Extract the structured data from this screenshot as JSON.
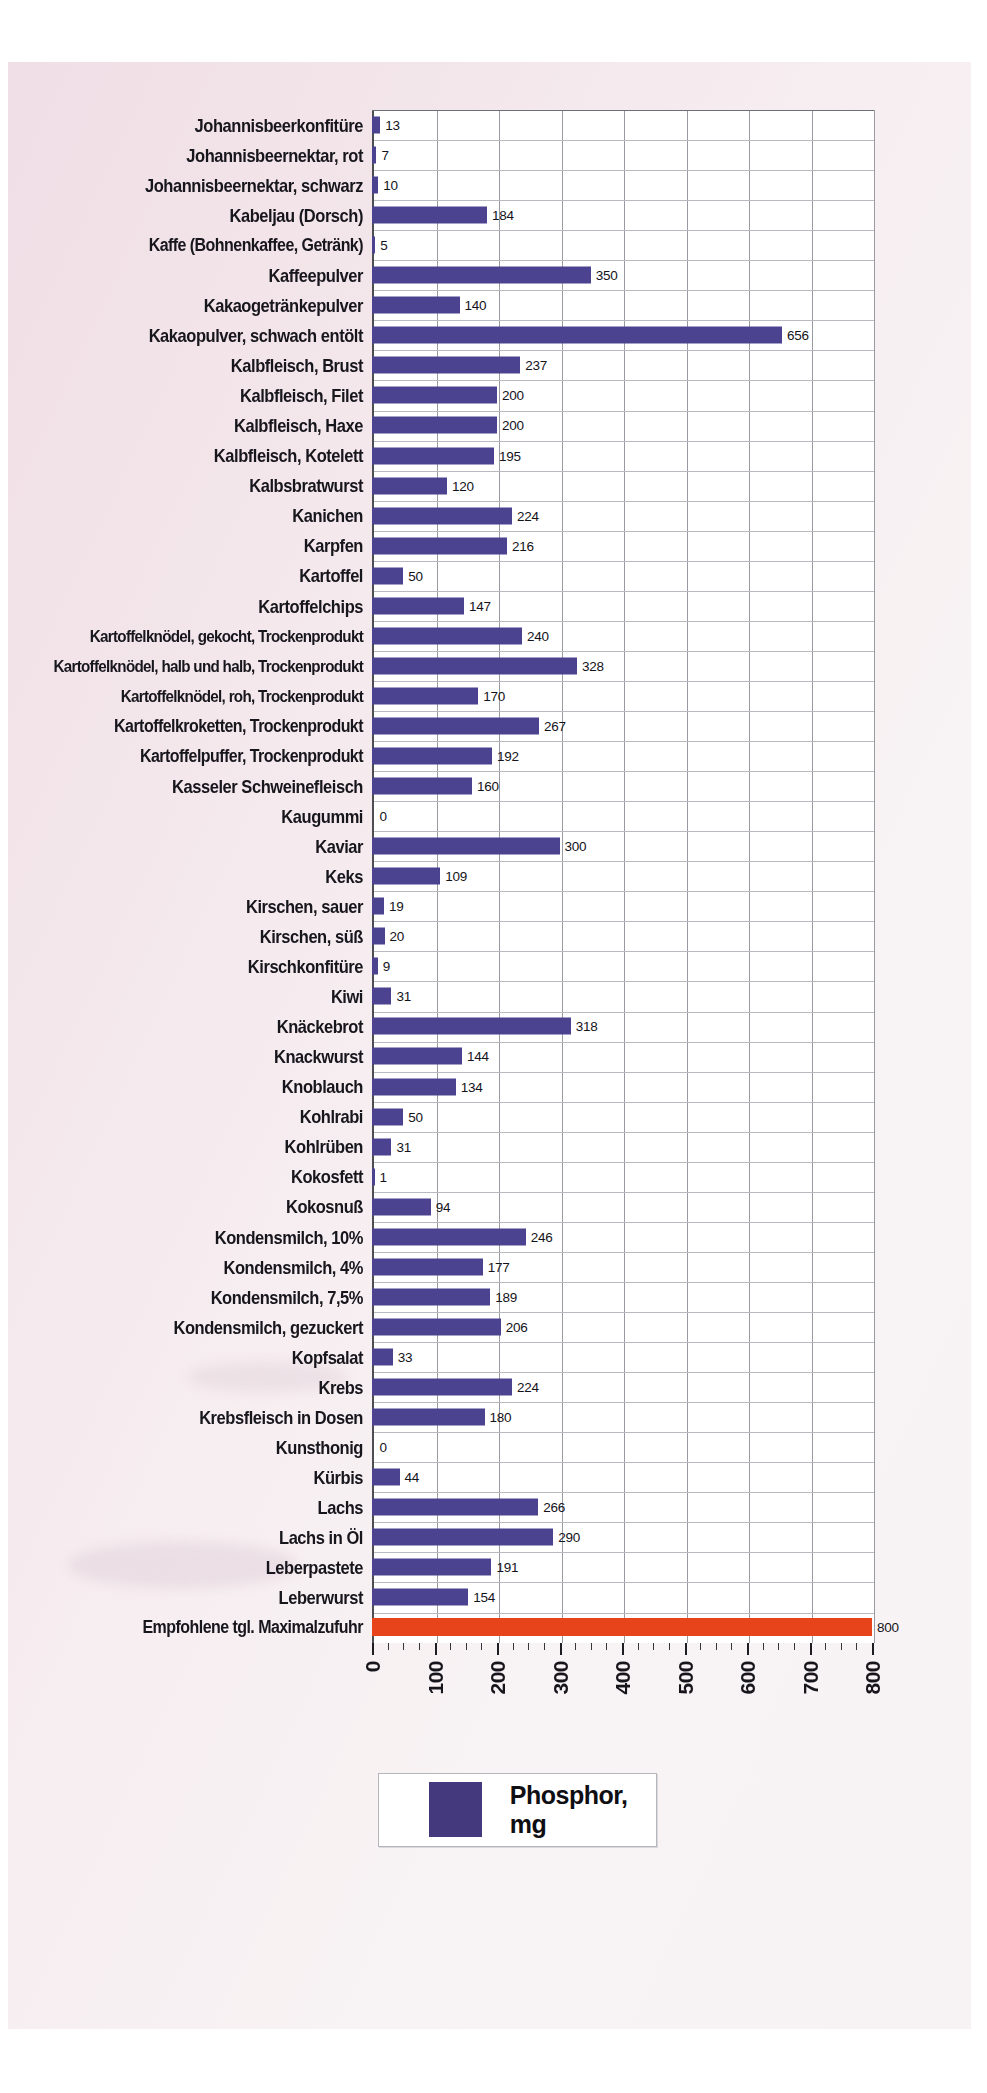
{
  "chart_data": {
    "type": "bar",
    "orientation": "horizontal",
    "title": "",
    "xlabel": "",
    "ylabel": "",
    "unit": "mg",
    "xlim": [
      0,
      800
    ],
    "xticks": [
      0,
      100,
      200,
      300,
      400,
      500,
      600,
      700,
      800
    ],
    "xtick_labels": [
      "0",
      "100",
      "200",
      "300",
      "400",
      "500",
      "600",
      "700",
      "800"
    ],
    "grid": true,
    "legend": {
      "position": "bottom",
      "entries": [
        {
          "label": "Phosphor, mg",
          "color": "#45397d"
        }
      ]
    },
    "series_color": "#4b4390",
    "limit_color": "#e8441b",
    "categories": [
      "Johannisbeerkonfitüre",
      "Johannisbeernektar, rot",
      "Johannisbeernektar, schwarz",
      "Kabeljau (Dorsch)",
      "Kaffe (Bohnenkaffee, Getränk)",
      "Kaffeepulver",
      "Kakaogetränkepulver",
      "Kakaopulver, schwach entölt",
      "Kalbfleisch, Brust",
      "Kalbfleisch, Filet",
      "Kalbfleisch, Haxe",
      "Kalbfleisch, Kotelett",
      "Kalbsbratwurst",
      "Kanichen",
      "Karpfen",
      "Kartoffel",
      "Kartoffelchips",
      "Kartoffelknödel, gekocht, Trockenprodukt",
      "Kartoffelknödel, halb und halb, Trockenprodukt",
      "Kartoffelknödel, roh, Trockenprodukt",
      "Kartoffelkroketten, Trockenprodukt",
      "Kartoffelpuffer, Trockenprodukt",
      "Kasseler Schweinefleisch",
      "Kaugummi",
      "Kaviar",
      "Keks",
      "Kirschen, sauer",
      "Kirschen, süß",
      "Kirschkonfitüre",
      "Kiwi",
      "Knäckebrot",
      "Knackwurst",
      "Knoblauch",
      "Kohlrabi",
      "Kohlrüben",
      "Kokosfett",
      "Kokosnuß",
      "Kondensmilch, 10%",
      "Kondensmilch, 4%",
      "Kondensmilch, 7,5%",
      "Kondensmilch, gezuckert",
      "Kopfsalat",
      "Krebs",
      "Krebsfleisch in Dosen",
      "Kunsthonig",
      "Kürbis",
      "Lachs",
      "Lachs in Öl",
      "Leberpastete",
      "Leberwurst",
      "Empfohlene tgl. Maximalzufuhr"
    ],
    "values": [
      13,
      7,
      10,
      184,
      5,
      350,
      140,
      656,
      237,
      200,
      200,
      195,
      120,
      224,
      216,
      50,
      147,
      240,
      328,
      170,
      267,
      192,
      160,
      0,
      300,
      109,
      19,
      20,
      9,
      31,
      318,
      144,
      134,
      50,
      31,
      1,
      94,
      246,
      177,
      189,
      206,
      33,
      224,
      180,
      0,
      44,
      266,
      290,
      191,
      154,
      800
    ],
    "limit_row_index": 50
  }
}
